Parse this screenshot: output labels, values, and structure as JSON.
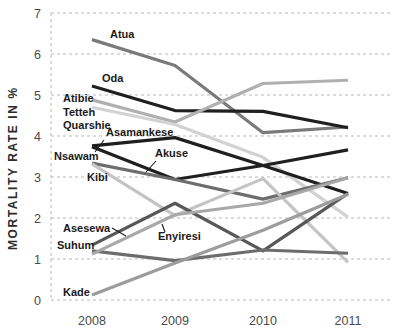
{
  "chart_data": {
    "type": "line",
    "title": "",
    "subtitle": "",
    "xlabel": "",
    "ylabel": "MORTALITY RATE IN %",
    "categories": [
      "2008",
      "2009",
      "2010",
      "2011"
    ],
    "x": [
      2008,
      2009,
      2010,
      2011
    ],
    "ylim": [
      0,
      7
    ],
    "yticks": [
      0,
      1,
      2,
      3,
      4,
      5,
      6,
      7
    ],
    "ytick_labels": [
      "0",
      "1",
      "2",
      "3",
      "4",
      "5",
      "6",
      "7"
    ],
    "xtick_labels": [
      "2008",
      "2009",
      "2010",
      "2011"
    ],
    "grid": "horizontal-dashed",
    "legend": "inline-labels",
    "legend_position": "inline",
    "series": [
      {
        "name": "Atua",
        "values": [
          6.35,
          5.72,
          4.08,
          4.22
        ],
        "color": "#7a7a7a",
        "width": 3.2
      },
      {
        "name": "Oda",
        "values": [
          5.22,
          4.62,
          4.6,
          4.2
        ],
        "color": "#1f1f1f",
        "width": 3.2
      },
      {
        "name": "Atibie",
        "values": [
          4.88,
          4.34,
          5.28,
          5.36
        ],
        "color": "#b0b0b0",
        "width": 3.2
      },
      {
        "name": "Tetteh Quarshie",
        "values": [
          4.7,
          4.28,
          3.48,
          2.02
        ],
        "color": "#d2d2d2",
        "width": 3.2
      },
      {
        "name": "Asamankese",
        "values": [
          3.76,
          3.96,
          3.28,
          2.6
        ],
        "color": "#1f1f1f",
        "width": 3.2
      },
      {
        "name": "Akuse",
        "values": [
          3.74,
          2.94,
          3.28,
          3.66
        ],
        "color": "#1f1f1f",
        "width": 3.2
      },
      {
        "name": "Nsawam",
        "values": [
          3.34,
          2.94,
          2.46,
          2.98
        ],
        "color": "#6d6d6d",
        "width": 3.2
      },
      {
        "name": "Kibi",
        "values": [
          3.32,
          2.06,
          2.96,
          0.92
        ],
        "color": "#c4c4c4",
        "width": 3.2
      },
      {
        "name": "Asesewa",
        "values": [
          1.34,
          2.36,
          1.2,
          2.6
        ],
        "color": "#585858",
        "width": 3.2
      },
      {
        "name": "Suhum",
        "values": [
          1.2,
          0.96,
          1.22,
          1.14
        ],
        "color": "#6d6d6d",
        "width": 3.2
      },
      {
        "name": "Enyiresi",
        "values": [
          1.12,
          2.08,
          2.36,
          2.98
        ],
        "color": "#a8a8a8",
        "width": 3.2
      },
      {
        "name": "Kade",
        "values": [
          0.12,
          0.9,
          1.7,
          2.58
        ],
        "color": "#9c9c9c",
        "width": 3.2
      }
    ],
    "annotations": [
      {
        "text": "Atua",
        "x": 110,
        "y": 38,
        "anchor": "start",
        "leader": null
      },
      {
        "text": "Oda",
        "x": 102,
        "y": 82,
        "anchor": "start",
        "leader": null
      },
      {
        "text": "Atibie",
        "x": 63,
        "y": 102,
        "anchor": "start",
        "leader": null
      },
      {
        "text": "Tetteh",
        "x": 63,
        "y": 116,
        "anchor": "start",
        "leader": null
      },
      {
        "text": "Quarshie",
        "x": 63,
        "y": 129,
        "anchor": "start",
        "leader": null
      },
      {
        "text": "Asamankese",
        "x": 106,
        "y": 136,
        "anchor": "start",
        "leader": "M104,140 L95,152"
      },
      {
        "text": "Nsawam",
        "x": 54,
        "y": 160,
        "anchor": "start",
        "leader": null
      },
      {
        "text": "Akuse",
        "x": 155,
        "y": 157,
        "anchor": "start",
        "leader": "M156,161 L146,172"
      },
      {
        "text": "Kibi",
        "x": 87,
        "y": 181,
        "anchor": "start",
        "leader": null
      },
      {
        "text": "Asesewa",
        "x": 63,
        "y": 232,
        "anchor": "start",
        "leader": "M112,228 L126,236"
      },
      {
        "text": "Suhum",
        "x": 57,
        "y": 249,
        "anchor": "start",
        "leader": null
      },
      {
        "text": "Enyiresi",
        "x": 158,
        "y": 240,
        "anchor": "start",
        "leader": "M165,232 L162,224"
      },
      {
        "text": "Kade",
        "x": 63,
        "y": 296,
        "anchor": "start",
        "leader": null
      }
    ],
    "plot_area": {
      "left": 51,
      "right": 390,
      "top": 13,
      "bottom": 300
    },
    "x_positions": [
      92,
      175,
      263,
      348
    ],
    "colors": {
      "background": "#ffffff",
      "grid": "#b9b9b9",
      "text": "#4a4a4a",
      "label_text": "#1a1a1a",
      "axis_title": "#2b2b2b"
    }
  }
}
